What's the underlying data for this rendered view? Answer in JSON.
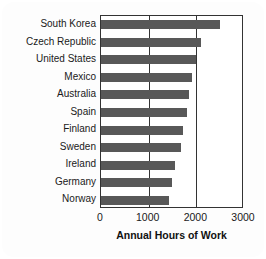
{
  "chart_data": {
    "type": "bar",
    "orientation": "horizontal",
    "title": "",
    "xlabel": "Annual Hours of Work",
    "ylabel": "",
    "xlim": [
      0,
      3000
    ],
    "xticks": [
      0,
      1000,
      2000,
      3000
    ],
    "xtick_labels": [
      "0",
      "1000",
      "2000",
      "3000"
    ],
    "grid": true,
    "legend": false,
    "categories": [
      "South Korea",
      "Czech Republic",
      "United States",
      "Mexico",
      "Australia",
      "Spain",
      "Finland",
      "Sweden",
      "Ireland",
      "Germany",
      "Norway"
    ],
    "values": [
      2500,
      2100,
      1990,
      1900,
      1850,
      1800,
      1720,
      1680,
      1550,
      1490,
      1420
    ],
    "bar_color": "#585858",
    "axis_color": "#333333",
    "background_color": "#ffffff"
  },
  "axis_title": "Annual Hours of Work"
}
